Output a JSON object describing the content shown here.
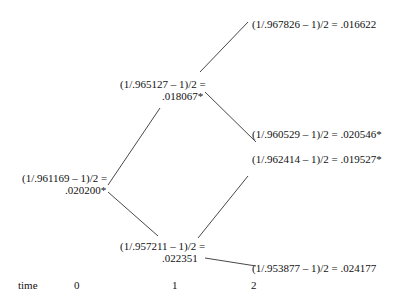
{
  "tree": {
    "root": {
      "line1": "(1/.961169 – 1)/2 =",
      "line2": ".020200*"
    },
    "up": {
      "line1": "(1/.965127 – 1)/2 =",
      "line2": ".018067*"
    },
    "down": {
      "line1": "(1/.957211 – 1)/2 =",
      "line2": ".022351"
    },
    "uu": "(1/.967826 – 1)/2 = .016622",
    "ud": "(1/.960529 – 1)/2 = .020546*",
    "du": "(1/.962414 – 1)/2 = .019527*",
    "dd": "(1/.953877 – 1)/2 = .024177"
  },
  "axis": {
    "label": "time",
    "ticks": [
      "0",
      "1",
      "2"
    ]
  },
  "colors": {
    "line": "#333333",
    "text": "#111111"
  }
}
